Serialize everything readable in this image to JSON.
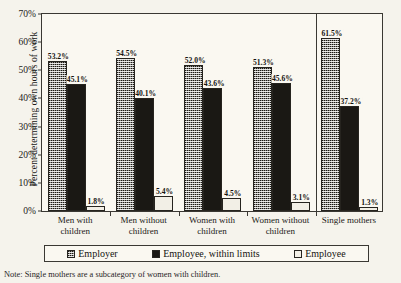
{
  "note": "Note: Single mothers are a subcategory of women with children.",
  "legend": {
    "items": [
      {
        "label": "Employer",
        "swatch": "employer-swatch"
      },
      {
        "label": "Employee, within limits",
        "swatch": "employee-within-limits-swatch"
      },
      {
        "label": "Employee",
        "swatch": "employee-swatch"
      }
    ]
  },
  "chart_data": {
    "type": "bar",
    "title": "",
    "xlabel": "",
    "ylabel": "Percent determining own hours of work",
    "ylim": [
      0,
      70
    ],
    "ytick_labels": [
      "0%",
      "10%",
      "20%",
      "30%",
      "40%",
      "50%",
      "60%",
      "70%"
    ],
    "ytick_values": [
      0,
      10,
      20,
      30,
      40,
      50,
      60,
      70
    ],
    "grid": false,
    "legend_position": "bottom",
    "categories": [
      "Men with children",
      "Men without children",
      "Women with children",
      "Women without children",
      "Single mothers"
    ],
    "category_lines": [
      [
        "Men with",
        "children"
      ],
      [
        "Men without",
        "children"
      ],
      [
        "Women with",
        "children"
      ],
      [
        "Women without",
        "children"
      ],
      [
        "Single mothers",
        ""
      ]
    ],
    "series": [
      {
        "name": "Employer",
        "values": [
          53.2,
          54.5,
          52.0,
          51.3,
          61.5
        ]
      },
      {
        "name": "Employee, within limits",
        "values": [
          45.1,
          40.1,
          43.6,
          45.6,
          37.2
        ]
      },
      {
        "name": "Employee",
        "values": [
          1.8,
          5.4,
          4.5,
          3.1,
          1.3
        ]
      }
    ],
    "data_labels": [
      [
        "53.2%",
        "45.1%",
        "1.8%"
      ],
      [
        "54.5%",
        "40.1%",
        "5.4%"
      ],
      [
        "52.0%",
        "43.6%",
        "4.5%"
      ],
      [
        "51.3%",
        "45.6%",
        "3.1%"
      ],
      [
        "61.5%",
        "37.2%",
        "1.3%"
      ]
    ]
  }
}
